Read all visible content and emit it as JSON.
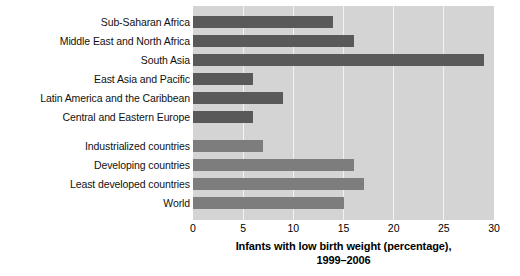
{
  "chart_data": {
    "type": "bar",
    "orientation": "horizontal",
    "title": "",
    "caption_line1": "Infants with low birth weight (percentage),",
    "caption_line2": "1999–2006",
    "xlabel": "Infants with low birth weight (percentage), 1999–2006",
    "ylabel": "",
    "xlim": [
      0,
      30
    ],
    "xticks": [
      0,
      5,
      10,
      15,
      20,
      25,
      30
    ],
    "xtick_labels": [
      "0",
      "5",
      "10",
      "15",
      "20",
      "25",
      "30"
    ],
    "grid": true,
    "grid_axis": "x",
    "legend": "none",
    "plot_background": "#d4d4d4",
    "gridline_color": "#f2f2f2",
    "categories": [
      "Sub-Saharan Africa",
      "Middle East and North Africa",
      "South Asia",
      "East Asia and Pacific",
      "Latin America and the Caribbean",
      "Central and Eastern Europe",
      "Industrialized countries",
      "Developing countries",
      "Least developed countries",
      "World"
    ],
    "values": [
      14,
      16,
      29,
      6,
      9,
      6,
      7,
      16,
      17,
      15
    ],
    "groups": [
      "region",
      "region",
      "region",
      "region",
      "region",
      "region",
      "aggregate",
      "aggregate",
      "aggregate",
      "aggregate"
    ],
    "group_colors": {
      "region": "#595959",
      "aggregate": "#7d7d7d"
    },
    "bars": [
      {
        "label": "Sub-Saharan Africa",
        "value": 14,
        "group": "region",
        "top": 10
      },
      {
        "label": "Middle East and North Africa",
        "value": 16,
        "group": "region",
        "top": 29
      },
      {
        "label": "South Asia",
        "value": 29,
        "group": "region",
        "top": 48
      },
      {
        "label": "East Asia and Pacific",
        "value": 6,
        "group": "region",
        "top": 67
      },
      {
        "label": "Latin America and the Caribbean",
        "value": 9,
        "group": "region",
        "top": 86
      },
      {
        "label": "Central and Eastern Europe",
        "value": 6,
        "group": "region",
        "top": 105
      },
      {
        "label": "Industrialized countries",
        "value": 7,
        "group": "aggregate",
        "top": 134
      },
      {
        "label": "Developing countries",
        "value": 16,
        "group": "aggregate",
        "top": 153
      },
      {
        "label": "Least developed countries",
        "value": 17,
        "group": "aggregate",
        "top": 172
      },
      {
        "label": "World",
        "value": 15,
        "group": "aggregate",
        "top": 191
      }
    ]
  }
}
